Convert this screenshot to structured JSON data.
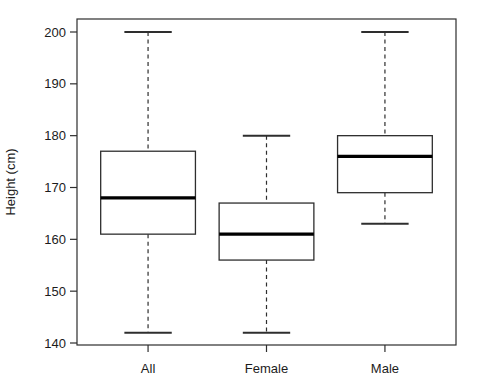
{
  "chart_data": {
    "type": "boxplot",
    "title": "",
    "xlabel": "",
    "ylabel": "Height (cm)",
    "categories": [
      "All",
      "Female",
      "Male"
    ],
    "series": [
      {
        "name": "All",
        "whisker_low": 142,
        "q1": 161,
        "median": 168,
        "q3": 177,
        "whisker_high": 200
      },
      {
        "name": "Female",
        "whisker_low": 142,
        "q1": 156,
        "median": 161,
        "q3": 167,
        "whisker_high": 180
      },
      {
        "name": "Male",
        "whisker_low": 163,
        "q1": 169,
        "median": 176,
        "q3": 180,
        "whisker_high": 200
      }
    ],
    "ylim": [
      140,
      200
    ],
    "yticks": [
      140,
      150,
      160,
      170,
      180,
      190,
      200
    ],
    "grid": false,
    "legend": false,
    "whisker_line_style": "dashed",
    "colors": {
      "line": "#2e2e2e",
      "median": "#000000",
      "box_fill": "#ffffff",
      "background": "#ffffff",
      "text": "#1c1c1c"
    }
  }
}
